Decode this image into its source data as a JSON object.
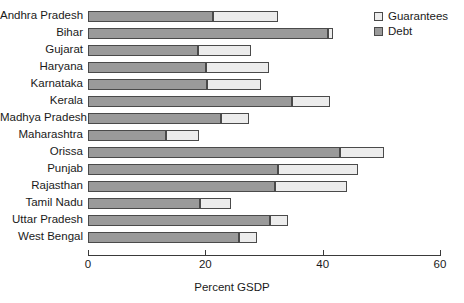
{
  "chart_data": {
    "type": "bar",
    "orientation": "horizontal",
    "stacked": true,
    "title": "",
    "xlabel": "Percent GSDP",
    "ylabel": "",
    "xlim": [
      0,
      60
    ],
    "xticks": [
      0,
      20,
      40,
      60
    ],
    "grid": false,
    "legend_position": "top-right",
    "categories": [
      "Andhra Pradesh",
      "Bihar",
      "Gujarat",
      "Haryana",
      "Karnataka",
      "Kerala",
      "Madhya Pradesh",
      "Maharashtra",
      "Orissa",
      "Punjab",
      "Rajasthan",
      "Tamil Nadu",
      "Uttar Pradesh",
      "West Bengal"
    ],
    "series": [
      {
        "name": "Debt",
        "color": "#9a9a9a",
        "values": [
          21.3,
          40.9,
          18.7,
          20.1,
          20.3,
          34.8,
          22.7,
          13.3,
          43.0,
          32.4,
          31.9,
          19.1,
          31.0,
          25.7
        ]
      },
      {
        "name": "Guarantees",
        "color": "#ececec",
        "values": [
          11.1,
          0.9,
          9.1,
          10.8,
          9.2,
          6.5,
          4.7,
          5.6,
          7.5,
          13.6,
          12.2,
          5.3,
          3.1,
          3.1
        ]
      }
    ],
    "totals": [
      32.4,
      41.8,
      27.8,
      30.9,
      29.5,
      41.3,
      27.4,
      18.9,
      50.5,
      46.0,
      44.1,
      24.4,
      34.1,
      28.8
    ]
  },
  "legend": {
    "items": [
      {
        "label": "Guarantees",
        "color": "#ececec"
      },
      {
        "label": "Debt",
        "color": "#9a9a9a"
      }
    ]
  },
  "axis": {
    "tick_labels": [
      "0",
      "20",
      "40",
      "60"
    ],
    "x_axis_title": "Percent GSDP"
  }
}
